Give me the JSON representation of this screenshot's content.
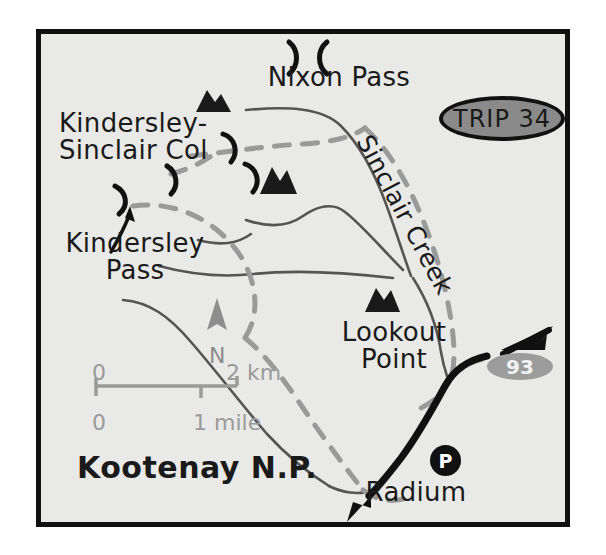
{
  "map": {
    "title_park": "Kootenay N.P.",
    "trip_badge": "TRIP 34",
    "highway_shield": "93",
    "parking_marker": "P",
    "compass_label": "N",
    "labels": {
      "kindersley_sinclair_col": "Kindersley-\nSinclair Col",
      "kindersley_pass": "Kindersley\nPass",
      "nixon_pass": "Nixon Pass",
      "lookout_point": "Lookout\nPoint",
      "sinclair_creek": "Sinclair Creek",
      "radium": "Radium"
    },
    "scale_bar": {
      "km_zero": "0",
      "km_max": "2 km",
      "mile_zero": "0",
      "mile_max": "1 mile"
    },
    "colors": {
      "background": "#e9e9e7",
      "frame": "#111111",
      "trail_dashed": "#9a9a9a",
      "stream": "#555555",
      "road": "#111111",
      "badge_fill": "#8a8a8a",
      "shield_fill": "#9c9c9c",
      "scale_text": "#9a9a9a",
      "peak_fill": "#1a1a1a"
    },
    "symbols": {
      "peaks": [
        {
          "name": "peak-kindersley",
          "x": 168,
          "y": 68
        },
        {
          "name": "peak-central",
          "x": 232,
          "y": 148
        },
        {
          "name": "peak-lookout",
          "x": 337,
          "y": 267
        }
      ],
      "passes": [
        {
          "name": "pass-nixon",
          "x": 262,
          "y": 20
        },
        {
          "name": "pass-sinclair-col-a",
          "x": 192,
          "y": 113
        },
        {
          "name": "pass-sinclair-col-b",
          "x": 213,
          "y": 140
        },
        {
          "name": "pass-kindersley-col",
          "x": 134,
          "y": 142
        },
        {
          "name": "pass-kindersley",
          "x": 82,
          "y": 165
        }
      ]
    }
  }
}
